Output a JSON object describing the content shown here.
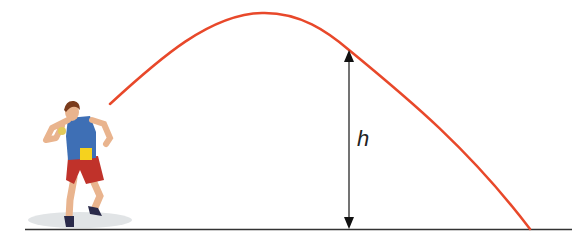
{
  "diagram": {
    "title": "",
    "labels": {
      "height": "h"
    },
    "colors": {
      "trajectory": "#e8482a",
      "ground": "#333333",
      "arrow": "#222222",
      "shirt": "#3e6fb5",
      "shorts": "#c0322a",
      "bib": "#f5d21e",
      "skin": "#e9b48e",
      "hair": "#7a3b1c"
    },
    "elements": [
      {
        "name": "athlete",
        "description": "shot-put thrower"
      },
      {
        "name": "trajectory",
        "description": "parabolic path of the shot"
      },
      {
        "name": "height-arrow",
        "description": "double-headed vertical arrow marking height h"
      },
      {
        "name": "ground-line"
      }
    ]
  }
}
